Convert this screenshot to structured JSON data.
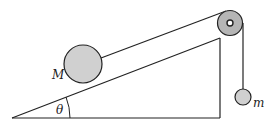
{
  "diagram": {
    "type": "physics-incline-pulley",
    "labels": {
      "big_mass": "M",
      "small_mass": "m",
      "angle": "θ"
    },
    "colors": {
      "line": "#222222",
      "mass_fill": "#d0d0d0",
      "pulley_fill": "#b5b5b5",
      "background": "#ffffff"
    }
  }
}
